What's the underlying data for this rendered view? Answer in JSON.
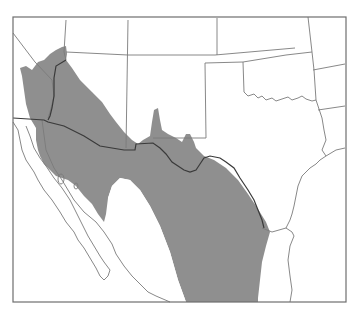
{
  "map": {
    "description": "Range map of southwestern United States and northern Mexico",
    "colors": {
      "background": "#ffffff",
      "range_fill": "#8f8f8f",
      "boundary": "#7a7a7a",
      "international_border": "#3a3a3a",
      "frame": "#6e6e6e"
    },
    "regions": [
      {
        "name": "California"
      },
      {
        "name": "Nevada"
      },
      {
        "name": "Utah"
      },
      {
        "name": "Colorado"
      },
      {
        "name": "Kansas"
      },
      {
        "name": "Missouri"
      },
      {
        "name": "Arizona"
      },
      {
        "name": "New Mexico"
      },
      {
        "name": "Oklahoma"
      },
      {
        "name": "Arkansas"
      },
      {
        "name": "Texas"
      },
      {
        "name": "Louisiana"
      },
      {
        "name": "Baja California"
      },
      {
        "name": "Sonora"
      },
      {
        "name": "Chihuahua"
      },
      {
        "name": "Coahuila"
      }
    ],
    "legend": {
      "range_label": "Shaded area: species range"
    }
  }
}
